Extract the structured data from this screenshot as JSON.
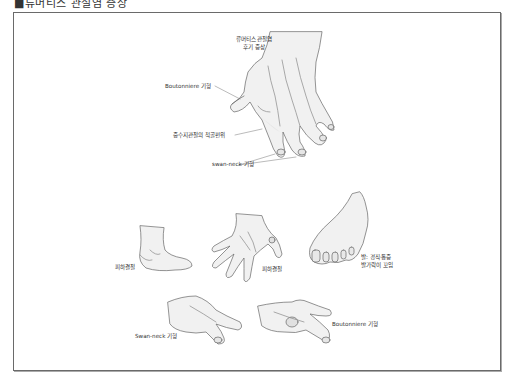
{
  "header": {
    "title": "■류머티스 관절염 증상"
  },
  "figure": {
    "main_hand": {
      "title_line1": "류머티스 관절염",
      "title_line2": "후기 증상",
      "labels": {
        "boutonniere": "Boutonniere 기형",
        "ulnar_deviation": "중수지관절의 척골편위",
        "swan_neck": "swan-neck 기형"
      }
    },
    "lower_row": {
      "ankle_label": "피하결절",
      "hand_label": "피하결절",
      "foot_label_line1": "발: 경직·통증",
      "foot_label_line2": "발가락이 꼬임"
    },
    "bottom_row": {
      "swan_neck_label": "Swan-neck 기형",
      "boutonniere_label": "Boutonniere 기형"
    }
  },
  "colors": {
    "frame": "#6a6a6a",
    "ink": "#555555",
    "shade": "#d8d8d8",
    "text": "#333333"
  }
}
